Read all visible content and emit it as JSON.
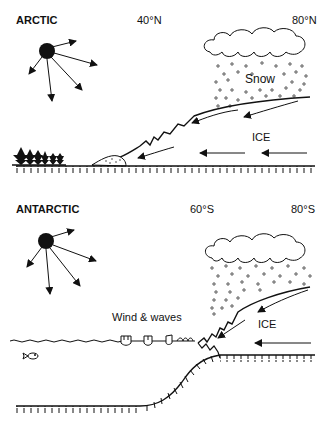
{
  "arctic": {
    "title": "ARCTIC",
    "lat_left": "40°N",
    "lat_right": "80°N",
    "snow_label": "Snow",
    "ice_label": "ICE"
  },
  "antarctic": {
    "title": "ANTARCTIC",
    "lat_left": "60°S",
    "lat_right": "80°S",
    "waves_label": "Wind & waves",
    "ice_label": "ICE"
  },
  "icons": {
    "sun": "sun-icon",
    "cloud": "cloud-icon",
    "trees": "conifer-trees-icon",
    "fish": "fish-icon"
  }
}
